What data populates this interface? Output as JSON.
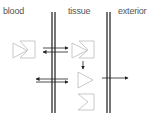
{
  "diagram": {
    "compartments": [
      {
        "id": "blood",
        "label": "blood",
        "x": 3
      },
      {
        "id": "tissue",
        "label": "tissue",
        "x": 68
      },
      {
        "id": "exterior",
        "label": "exterior",
        "x": 118
      }
    ],
    "membranes": [
      {
        "id": "blood-tissue-membrane",
        "x": 53,
        "y1": 12,
        "y2": 113
      },
      {
        "id": "tissue-exterior-membrane",
        "x": 108,
        "y1": 12,
        "y2": 113
      }
    ],
    "arrows": [
      {
        "id": "blood-to-tissue-arrow",
        "from": "blood",
        "to": "tissue",
        "direction": "right"
      },
      {
        "id": "tissue-to-blood-arrow",
        "from": "tissue",
        "to": "blood",
        "direction": "left"
      },
      {
        "id": "tissue-down-arrow",
        "from": "tissue-complex",
        "to": "tissue-free",
        "direction": "down"
      },
      {
        "id": "lower-blood-left-arrow",
        "from": "tissue",
        "to": "blood",
        "direction": "left"
      },
      {
        "id": "lower-tissue-right-arrow",
        "from": "blood",
        "to": "tissue",
        "direction": "right"
      },
      {
        "id": "tissue-to-exterior-arrow",
        "from": "tissue",
        "to": "exterior",
        "direction": "right"
      }
    ],
    "colors": {
      "membrane": "#1a1a1a",
      "arrow": "#222222",
      "shape": "#bbbbbb",
      "text": "#555555"
    }
  }
}
